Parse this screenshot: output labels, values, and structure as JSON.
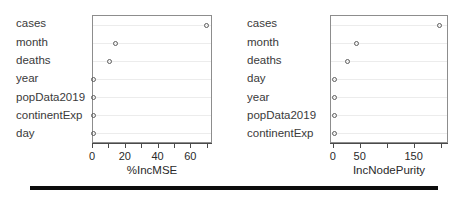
{
  "figure": {
    "background": "#ffffff",
    "marker_color": "#5d5d5d",
    "frame_color": "#8d8d8d",
    "grid_color": "#ececec",
    "rule_color": "#0d0d0d"
  },
  "chart_data": [
    {
      "type": "scatter",
      "panel": "left",
      "title": "",
      "xlabel": "%IncMSE",
      "ylabel": "",
      "xlim": [
        0,
        72
      ],
      "xticks": [
        0,
        10,
        20,
        30,
        40,
        50,
        60,
        70
      ],
      "xticklabels": [
        "0",
        "",
        "20",
        "",
        "40",
        "",
        "60",
        ""
      ],
      "grid": true,
      "legend": "none",
      "categories": [
        "cases",
        "month",
        "deaths",
        "year",
        "popData2019",
        "continentExp",
        "day"
      ],
      "values": [
        69,
        14,
        10,
        0.6,
        0.5,
        0.5,
        0.4
      ],
      "points": [
        {
          "label": "cases",
          "value": 69
        },
        {
          "label": "month",
          "value": 14
        },
        {
          "label": "deaths",
          "value": 10
        },
        {
          "label": "year",
          "value": 0.6
        },
        {
          "label": "popData2019",
          "value": 0.5
        },
        {
          "label": "continentExp",
          "value": 0.5
        },
        {
          "label": "day",
          "value": 0.4
        }
      ]
    },
    {
      "type": "scatter",
      "panel": "right",
      "title": "",
      "xlabel": "IncNodePurity",
      "ylabel": "",
      "xlim": [
        -5,
        210
      ],
      "xticks": [
        0,
        50,
        100,
        150,
        200
      ],
      "xticklabels": [
        "0",
        "50",
        "",
        "150",
        ""
      ],
      "grid": true,
      "legend": "none",
      "categories": [
        "cases",
        "month",
        "deaths",
        "day",
        "year",
        "popData2019",
        "continentExp"
      ],
      "values": [
        196,
        42,
        25,
        2,
        2,
        2,
        2
      ],
      "points": [
        {
          "label": "cases",
          "value": 196
        },
        {
          "label": "month",
          "value": 42
        },
        {
          "label": "deaths",
          "value": 25
        },
        {
          "label": "day",
          "value": 2
        },
        {
          "label": "year",
          "value": 2
        },
        {
          "label": "popData2019",
          "value": 2
        },
        {
          "label": "continentExp",
          "value": 2
        }
      ]
    }
  ]
}
